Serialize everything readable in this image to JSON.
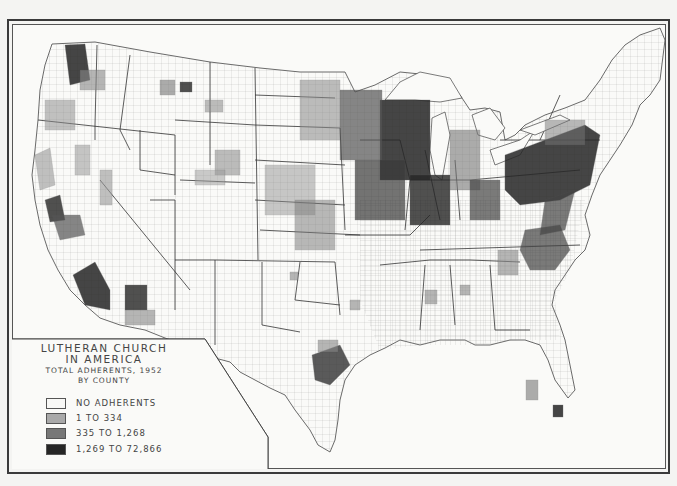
{
  "map": {
    "title": "LUTHERAN CHURCH",
    "subtitle": "IN AMERICA",
    "description": "TOTAL ADHERENTS, 1952",
    "unit": "BY COUNTY",
    "region": "Contiguous United States, county level"
  },
  "legend": {
    "items": [
      {
        "label": "NO ADHERENTS",
        "color": "#f8f8f6"
      },
      {
        "label": "1 TO 334",
        "color": "#a9a9a9"
      },
      {
        "label": "335 TO 1,268",
        "color": "#777777"
      },
      {
        "label": "1,269 TO 72,866",
        "color": "#262626"
      }
    ]
  },
  "colors": {
    "background": "#fafaf8",
    "border": "#3a3a3a",
    "county_line": "#6a6a6a"
  }
}
